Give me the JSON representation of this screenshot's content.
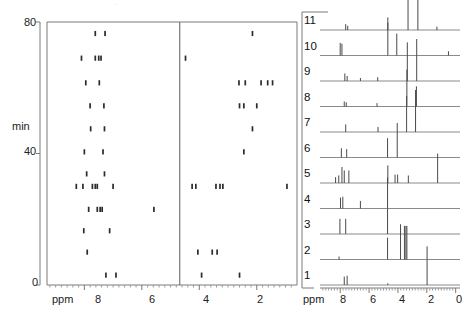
{
  "figure": {
    "type": "nmr-2d-tracking-plus-stacked-spectra",
    "background": "#ffffff",
    "ink": "#2b2b2b"
  },
  "left_panel": {
    "name": "time-resolved-peak-map",
    "y_axis": {
      "label": "min",
      "ticks": [
        0,
        40,
        80
      ],
      "tick_labels": [
        "0",
        "40",
        "80"
      ],
      "range": [
        0,
        80
      ]
    },
    "x_axis": {
      "label": "ppm",
      "ticks": [
        8,
        6,
        4,
        2
      ],
      "tick_labels": [
        "8",
        "6",
        "4",
        "2"
      ],
      "range": [
        9.3,
        0.6
      ],
      "reversed": true
    },
    "divider_ppm": 4.68,
    "rows": [
      {
        "time": 76.5,
        "dots": [
          [
            7.62,
            1
          ],
          [
            7.28,
            1
          ],
          [
            2.15,
            1
          ]
        ]
      },
      {
        "time": 69.0,
        "dots": [
          [
            8.1,
            1
          ],
          [
            7.62,
            1
          ],
          [
            7.5,
            1
          ],
          [
            7.42,
            1
          ],
          [
            4.48,
            1
          ]
        ]
      },
      {
        "time": 61.5,
        "dots": [
          [
            7.95,
            1
          ],
          [
            7.48,
            1
          ],
          [
            2.62,
            1
          ],
          [
            2.4,
            1
          ],
          [
            1.85,
            1
          ],
          [
            1.62,
            1
          ],
          [
            1.45,
            1
          ]
        ]
      },
      {
        "time": 54.5,
        "dots": [
          [
            7.8,
            1
          ],
          [
            7.32,
            1
          ],
          [
            2.6,
            1
          ],
          [
            2.45,
            1
          ],
          [
            2.0,
            1
          ]
        ]
      },
      {
        "time": 47.5,
        "dots": [
          [
            7.78,
            1
          ],
          [
            7.3,
            1
          ],
          [
            2.15,
            1
          ]
        ]
      },
      {
        "time": 40.5,
        "dots": [
          [
            8.0,
            1
          ],
          [
            7.35,
            1
          ],
          [
            2.45,
            1
          ]
        ]
      },
      {
        "time": 33.8,
        "dots": [
          [
            7.92,
            1
          ],
          [
            7.3,
            1
          ]
        ]
      },
      {
        "time": 30.0,
        "dots": [
          [
            8.28,
            1
          ],
          [
            8.05,
            1
          ],
          [
            7.72,
            1
          ],
          [
            7.62,
            1
          ],
          [
            7.55,
            1
          ],
          [
            7.0,
            1
          ],
          [
            4.25,
            1
          ],
          [
            4.12,
            1
          ],
          [
            3.42,
            1
          ],
          [
            3.28,
            1
          ],
          [
            3.18,
            1
          ],
          [
            0.95,
            1
          ]
        ]
      },
      {
        "time": 23.0,
        "dots": [
          [
            7.85,
            1
          ],
          [
            7.55,
            1
          ],
          [
            7.45,
            1
          ],
          [
            7.38,
            1
          ],
          [
            5.58,
            1
          ]
        ]
      },
      {
        "time": 16.5,
        "dots": [
          [
            8.02,
            1
          ],
          [
            7.12,
            1
          ]
        ]
      },
      {
        "time": 10.0,
        "dots": [
          [
            7.9,
            1
          ],
          [
            4.05,
            1
          ],
          [
            3.55,
            1
          ],
          [
            3.38,
            1
          ]
        ]
      },
      {
        "time": 3.0,
        "dots": [
          [
            7.25,
            1
          ],
          [
            6.9,
            1
          ],
          [
            3.92,
            1
          ],
          [
            2.6,
            1
          ]
        ]
      }
    ]
  },
  "right_panel": {
    "name": "stacked-1d-spectra",
    "x_axis": {
      "label": "ppm",
      "ticks": [
        8,
        6,
        4,
        2,
        0
      ],
      "tick_labels": [
        "8",
        "6",
        "4",
        "2",
        "0"
      ],
      "range": [
        9.4,
        -0.3
      ],
      "reversed": true
    },
    "traces": [
      {
        "label": "11",
        "peaks": [
          [
            7.62,
            0.14
          ],
          [
            7.48,
            0.1
          ],
          [
            4.7,
            0.3
          ],
          [
            3.3,
            0.92
          ],
          [
            2.62,
            1.0
          ],
          [
            1.3,
            0.08
          ]
        ]
      },
      {
        "label": "10",
        "peaks": [
          [
            8.0,
            0.3
          ],
          [
            7.88,
            0.28
          ],
          [
            4.7,
            0.78
          ],
          [
            4.08,
            0.52
          ],
          [
            0.5,
            0.1
          ]
        ]
      },
      {
        "label": "9",
        "peaks": [
          [
            7.68,
            0.18
          ],
          [
            7.52,
            0.12
          ],
          [
            6.6,
            0.07
          ],
          [
            5.4,
            0.09
          ],
          [
            3.35,
            0.92
          ],
          [
            2.7,
            1.0
          ]
        ]
      },
      {
        "label": "8",
        "peaks": [
          [
            7.72,
            0.12
          ],
          [
            7.58,
            0.1
          ],
          [
            5.45,
            0.08
          ],
          [
            3.38,
            0.88
          ],
          [
            2.72,
            0.48
          ]
        ]
      },
      {
        "label": "7",
        "peaks": [
          [
            7.62,
            0.18
          ],
          [
            5.38,
            0.12
          ],
          [
            3.4,
            0.86
          ],
          [
            2.78,
            1.0
          ]
        ]
      },
      {
        "label": "6",
        "peaks": [
          [
            7.92,
            0.22
          ],
          [
            7.55,
            0.2
          ],
          [
            4.72,
            0.46
          ],
          [
            4.05,
            0.82
          ]
        ]
      },
      {
        "label": "5",
        "peaks": [
          [
            8.32,
            0.14
          ],
          [
            8.1,
            0.18
          ],
          [
            7.88,
            0.38
          ],
          [
            7.72,
            0.3
          ],
          [
            7.4,
            0.3
          ],
          [
            4.7,
            0.42
          ],
          [
            4.2,
            0.2
          ],
          [
            4.02,
            0.2
          ],
          [
            3.28,
            0.18
          ],
          [
            1.25,
            0.7
          ]
        ]
      },
      {
        "label": "4",
        "peaks": [
          [
            7.98,
            0.26
          ],
          [
            7.82,
            0.28
          ],
          [
            6.6,
            0.18
          ],
          [
            4.72,
            0.74
          ]
        ]
      },
      {
        "label": "3",
        "peaks": [
          [
            8.02,
            0.36
          ],
          [
            7.62,
            0.36
          ],
          [
            4.72,
            0.6
          ]
        ]
      },
      {
        "label": "2",
        "peaks": [
          [
            8.08,
            0.07
          ],
          [
            4.72,
            0.52
          ],
          [
            3.82,
            0.84
          ],
          [
            3.55,
            0.8
          ],
          [
            3.45,
            0.8
          ],
          [
            3.38,
            0.8
          ]
        ]
      },
      {
        "label": "1",
        "peaks": [
          [
            7.72,
            0.2
          ],
          [
            7.52,
            0.22
          ],
          [
            4.7,
            0.04
          ],
          [
            1.98,
            0.92
          ]
        ]
      }
    ]
  }
}
